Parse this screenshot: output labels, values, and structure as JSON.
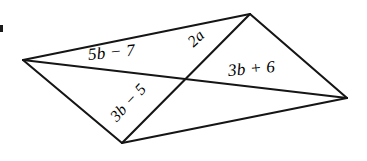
{
  "figure": {
    "name": "quadrilateral-with-diagonals",
    "background_color": "#ffffff",
    "stroke_color": "#151515",
    "text_color": "#000000",
    "vertices": {
      "left": {
        "x": 23,
        "y": 60
      },
      "top": {
        "x": 250,
        "y": 14
      },
      "right": {
        "x": 347,
        "y": 98
      },
      "bottom": {
        "x": 122,
        "y": 143
      }
    },
    "intersection": {
      "x": 185,
      "y": 78
    },
    "edges": [
      {
        "name": "edge-left-top",
        "from": "left",
        "to": "top"
      },
      {
        "name": "edge-top-right",
        "from": "top",
        "to": "right"
      },
      {
        "name": "edge-right-bottom",
        "from": "right",
        "to": "bottom"
      },
      {
        "name": "edge-bottom-left",
        "from": "bottom",
        "to": "left"
      }
    ],
    "diagonals": [
      {
        "name": "diagonal-left-right",
        "from": "left",
        "to": "right"
      },
      {
        "name": "diagonal-top-bottom",
        "from": "top",
        "to": "bottom"
      }
    ],
    "labels": {
      "upper_left_segment": "5b − 7",
      "upper_right_segment": "2a",
      "lower_right_segment": "3b + 6",
      "lower_left_segment": "3b − 5"
    }
  }
}
